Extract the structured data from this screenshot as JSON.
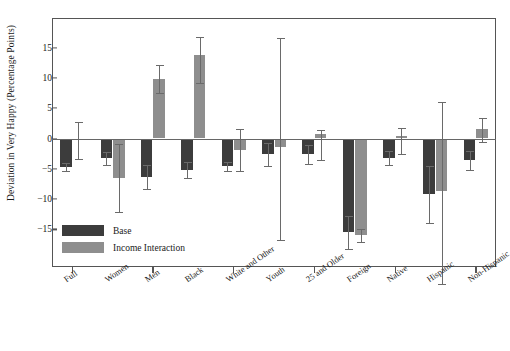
{
  "chart_data": {
    "type": "bar",
    "title": "",
    "xlabel": "",
    "ylabel": "Deviation in Very Happy (Percentage Points)",
    "ylim": [
      -18.5,
      18.0
    ],
    "yticks": [
      15,
      10,
      5,
      0,
      -5,
      -10,
      -15
    ],
    "ytick_labels": [
      "15",
      "10",
      "5",
      "0",
      "−5",
      "−10",
      "−15"
    ],
    "grid": false,
    "legend_position": "lower-left-inside",
    "categories": [
      "Full",
      "Women",
      "Men",
      "Black",
      "White and Other",
      "Youth",
      "25 and Older",
      "Foreign",
      "Native",
      "Hispanic",
      "Non-Hispanic"
    ],
    "series": [
      {
        "name": "Base",
        "color": "#3c3c3c",
        "values": [
          -4.7,
          -3.3,
          -6.3,
          -5.2,
          -4.6,
          -2.6,
          -2.6,
          -15.5,
          -3.2,
          -9.2,
          -3.6
        ],
        "err_low": [
          -5.4,
          -4.4,
          -8.4,
          -6.6,
          -5.4,
          -4.6,
          -4.2,
          -18.2,
          -4.4,
          -14.0,
          -5.2
        ],
        "err_high": [
          -4.0,
          -2.2,
          -4.3,
          -3.8,
          -3.8,
          -0.7,
          -1.0,
          -12.8,
          -2.0,
          -4.5,
          -2.0
        ]
      },
      {
        "name": "Income Interaction",
        "color": "#8e8e8e",
        "values": [
          -0.3,
          -6.5,
          9.9,
          13.8,
          -1.9,
          -1.4,
          0.7,
          -16.0,
          0.4,
          -8.6,
          1.5
        ]
      }
    ],
    "income_err_low": [
      -3.4,
      -12.2,
      7.5,
      9.2,
      -5.3,
      -16.8,
      -3.6,
      -17.0,
      -2.5,
      -24.0,
      -0.6
    ],
    "income_err_high": [
      2.8,
      -0.9,
      12.1,
      16.8,
      1.6,
      16.6,
      1.4,
      -15.0,
      1.8,
      6.0,
      3.4
    ],
    "legend": [
      {
        "label": "Base",
        "color": "#3c3c3c"
      },
      {
        "label": "Income Interaction",
        "color": "#8e8e8e"
      }
    ]
  }
}
